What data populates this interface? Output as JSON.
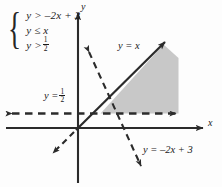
{
  "figure": {
    "type": "inequality-system-graph",
    "width": 222,
    "height": 187,
    "background_color": "#fdfdfd",
    "ink_color": "#1a1a1a",
    "shade_color": "#c8c8c8"
  },
  "system": {
    "brace_glyph": "{",
    "inequalities": [
      {
        "lhs": "y",
        "relation": ">",
        "rhs": "–2x + 3",
        "text": "y > –2x + 3"
      },
      {
        "lhs": "y",
        "relation": "≤",
        "rhs": "x",
        "text": "y ≤ x"
      },
      {
        "lhs": "y",
        "relation": ">",
        "rhs": "1/2",
        "text": "y > 1/2",
        "numerator": "1",
        "denominator": "2"
      }
    ]
  },
  "axes": {
    "x_label": "x",
    "y_label": "y",
    "origin": {
      "x": 78,
      "y": 128
    }
  },
  "lines": [
    {
      "name": "line-y-equals-x",
      "label": "y = x",
      "equation": "y = x",
      "style": "solid-with-dashed-extension",
      "boundary_inclusive": true,
      "slope": 1,
      "intercept": 0,
      "label_position": {
        "x": 118,
        "y": 41
      }
    },
    {
      "name": "line-y-equals-one-half",
      "label": "y =",
      "equation": "y = 1/2",
      "numerator": "1",
      "denominator": "2",
      "style": "dashed",
      "boundary_inclusive": false,
      "slope": 0,
      "intercept": 0.5,
      "label_position": {
        "x": 44,
        "y": 88
      }
    },
    {
      "name": "line-y-equals-neg-2x-plus-3",
      "label": "y = –2x + 3",
      "equation": "y = –2x + 3",
      "style": "dashed",
      "boundary_inclusive": false,
      "slope": -2,
      "intercept": 3,
      "label_position": {
        "x": 143,
        "y": 145
      }
    }
  ],
  "shaded_region": {
    "name": "solution-region",
    "description": "solution set of the system",
    "fill": "#c8c8c8"
  }
}
